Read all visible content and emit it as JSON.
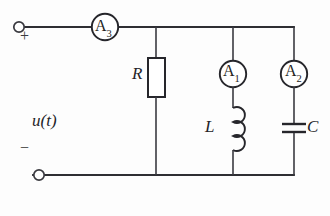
{
  "diagram": {
    "background_color": "#fdfdfd",
    "line_color": "#26262b",
    "source": {
      "label": "u(t)",
      "plus_sign": "+",
      "minus_sign": "−",
      "top_terminal_name": "positive-terminal",
      "bottom_terminal_name": "negative-terminal"
    },
    "meters": [
      {
        "id": "A3",
        "letter": "A",
        "subscript": "3",
        "position": "series-input"
      },
      {
        "id": "A1",
        "letter": "A",
        "subscript": "1",
        "position": "inductor-branch"
      },
      {
        "id": "A2",
        "letter": "A",
        "subscript": "2",
        "position": "capacitor-branch"
      }
    ],
    "components": [
      {
        "id": "R",
        "label": "R",
        "type": "resistor",
        "branch": 1
      },
      {
        "id": "L",
        "label": "L",
        "type": "inductor",
        "branch": 2
      },
      {
        "id": "C",
        "label": "C",
        "type": "capacitor",
        "branch": 3
      }
    ]
  }
}
